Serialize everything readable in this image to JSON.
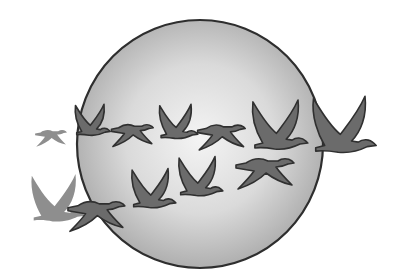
{
  "illustration": {
    "subject": "geese flying in formation across a large sphere",
    "background_color": "#ffffff",
    "sphere": {
      "cx": 200,
      "cy": 144,
      "rx": 123,
      "ry": 124,
      "gradient_center": "#f4f4f4",
      "gradient_mid": "#dadada",
      "gradient_edge": "#a9a9a9",
      "outline_color": "#2e2e2e"
    },
    "goose_colors": {
      "fill": "#6b6b6b",
      "outline": "#303030",
      "faded_fill": "#8e8e8e"
    },
    "geese": [
      {
        "id": "faded-small-flat",
        "pose": "flat",
        "x": 34,
        "y": 128,
        "scale": 0.55,
        "faded": true
      },
      {
        "id": "faded-wings-up",
        "pose": "up",
        "x": 28,
        "y": 172,
        "scale": 0.95,
        "faded": true
      },
      {
        "id": "row1-goose-1",
        "pose": "up",
        "x": 73,
        "y": 103,
        "scale": 0.62,
        "faded": false
      },
      {
        "id": "row1-goose-2",
        "pose": "flat",
        "x": 110,
        "y": 122,
        "scale": 0.72,
        "faded": false
      },
      {
        "id": "row1-goose-3",
        "pose": "up",
        "x": 157,
        "y": 103,
        "scale": 0.68,
        "faded": false
      },
      {
        "id": "row1-goose-4",
        "pose": "flat",
        "x": 196,
        "y": 122,
        "scale": 0.82,
        "faded": false
      },
      {
        "id": "row1-goose-5",
        "pose": "up",
        "x": 249,
        "y": 98,
        "scale": 0.98,
        "faded": false
      },
      {
        "id": "row1-goose-lead",
        "pose": "up",
        "x": 309,
        "y": 94,
        "scale": 1.12,
        "faded": false
      },
      {
        "id": "row2-goose-1",
        "pose": "flat",
        "x": 66,
        "y": 198,
        "scale": 0.98,
        "faded": false
      },
      {
        "id": "row2-goose-2",
        "pose": "up",
        "x": 129,
        "y": 167,
        "scale": 0.78,
        "faded": false
      },
      {
        "id": "row2-goose-3",
        "pose": "up",
        "x": 176,
        "y": 155,
        "scale": 0.78,
        "faded": false
      },
      {
        "id": "row2-goose-4",
        "pose": "flat",
        "x": 234,
        "y": 155,
        "scale": 1.0,
        "faded": false
      }
    ]
  }
}
